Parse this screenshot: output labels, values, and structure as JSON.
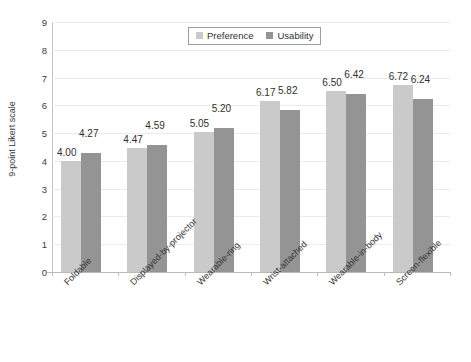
{
  "chart_data": {
    "type": "bar",
    "title": "",
    "xlabel": "",
    "ylabel": "9-point Likert scale",
    "ylim": [
      0,
      9
    ],
    "ytick_step": 1,
    "yticks": [
      "9",
      "8",
      "7",
      "6",
      "5",
      "4",
      "3",
      "2",
      "1",
      "0"
    ],
    "grid": true,
    "grid_axis": "y",
    "legend_position": "top-center",
    "categories": [
      "Foldable",
      "Displayed-by-projector",
      "Wearable-ring",
      "Wrist-attached",
      "Wearable-in-body",
      "Screen-flexible"
    ],
    "series": [
      {
        "name": "Preference",
        "color": "#cacaca",
        "values": [
          4.0,
          4.47,
          5.05,
          6.17,
          6.5,
          6.72
        ],
        "labels": [
          "4.00",
          "4.47",
          "5.05",
          "6.17",
          "6.50",
          "6.72"
        ]
      },
      {
        "name": "Usability",
        "color": "#949494",
        "values": [
          4.27,
          4.59,
          5.2,
          5.82,
          6.42,
          6.24
        ],
        "labels": [
          "4.27",
          "4.59",
          "5.20",
          "5.82",
          "6.42",
          "6.24"
        ]
      }
    ]
  },
  "legend": {
    "items": [
      {
        "label": "Preference",
        "color": "#cacaca"
      },
      {
        "label": "Usability",
        "color": "#949494"
      }
    ]
  }
}
